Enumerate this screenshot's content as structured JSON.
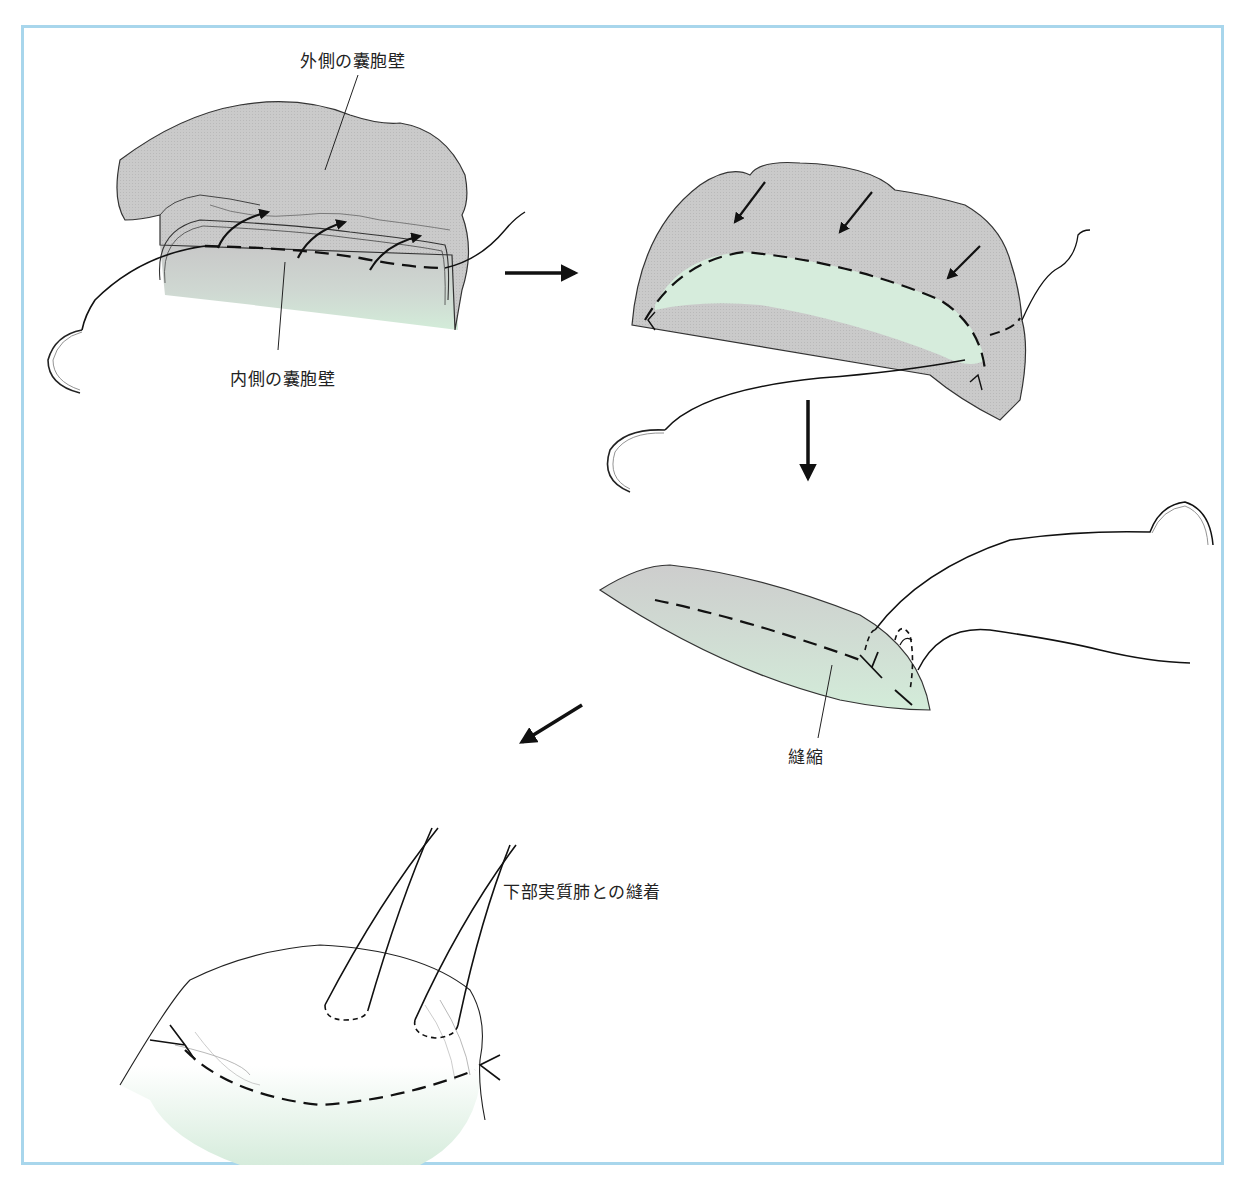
{
  "figure": {
    "border_color": "#a8d6ec",
    "tissue_gray": "#c9c9c9",
    "tissue_green": "#d6ecdc",
    "panels": [
      {
        "id": "step-1",
        "description": "outer and inner cyst walls sutured with curved needle"
      },
      {
        "id": "step-2",
        "description": "cyst wall folded inward, suture line"
      },
      {
        "id": "step-3",
        "description": "plication stitches tied"
      },
      {
        "id": "step-4",
        "description": "fixation sutures to lower lung parenchyma"
      }
    ],
    "labels": {
      "outer_cyst_wall": "外側の囊胞壁",
      "inner_cyst_wall": "内側の囊胞壁",
      "plication": "縫縮",
      "suture_to_lower_lung": "下部実質肺との縫着"
    },
    "arrows": [
      {
        "from": "step-1",
        "to": "step-2",
        "direction": "right"
      },
      {
        "from": "step-2",
        "to": "step-3",
        "direction": "down"
      },
      {
        "from": "step-3",
        "to": "step-4",
        "direction": "down-left"
      }
    ]
  }
}
